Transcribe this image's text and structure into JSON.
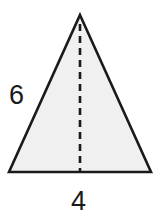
{
  "figure": {
    "name": "isosceles-triangle-with-height",
    "shape_label": "triangle",
    "fill_color": "#f0f0f0",
    "stroke_color": "#1a1a1a",
    "background_color": "#ffffff",
    "stroke_width": 2.5,
    "altitude": {
      "style": "dashed",
      "dash_length": 7,
      "gap_length": 5,
      "color": "#1a1a1a",
      "width": 2.5
    },
    "vertices": {
      "apex": [
        80,
        15
      ],
      "base_left": [
        9,
        172
      ],
      "base_right": [
        151,
        172
      ]
    }
  },
  "labels": {
    "side": "6",
    "base": "4"
  }
}
